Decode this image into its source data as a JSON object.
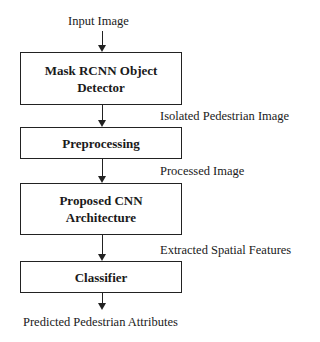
{
  "diagram": {
    "type": "flowchart",
    "input_label": "Input Image",
    "steps": [
      {
        "id": "detector",
        "label_line1": "Mask RCNN Object",
        "label_line2": "Detector"
      },
      {
        "id": "preprocessing",
        "label_line1": "Preprocessing"
      },
      {
        "id": "cnn",
        "label_line1": "Proposed CNN",
        "label_line2": "Architecture"
      },
      {
        "id": "classifier",
        "label_line1": "Classifier"
      }
    ],
    "edge_labels": [
      "Isolated Pedestrian Image",
      "Processed Image",
      "Extracted Spatial Features"
    ],
    "output_label": "Predicted Pedestrian Attributes"
  }
}
